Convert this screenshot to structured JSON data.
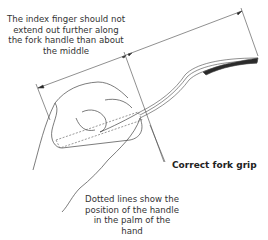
{
  "diagram": {
    "top_note": "The index finger should not extend out further along the fork handle than about the middle",
    "caption": "Correct fork grip",
    "bottom_note": "Dotted lines show the position of the handle in the palm of the hand",
    "line_color": "#333333",
    "fork_dark_color": "#2a2a2a"
  }
}
